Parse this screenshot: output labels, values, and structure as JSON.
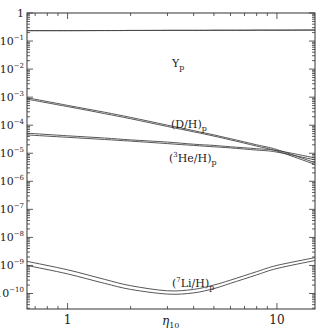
{
  "chart_data": {
    "type": "line",
    "title": "",
    "xlabel": "η10",
    "ylabel": "",
    "xscale": "log",
    "yscale": "log",
    "xlim": [
      0.64,
      15.2
    ],
    "ylim": [
      2.8e-11,
      1
    ],
    "x_tick_labels": [
      "1",
      "10"
    ],
    "y_tick_labels": [
      "1",
      "10^-1",
      "10^-2",
      "10^-3",
      "10^-4",
      "10^-5",
      "10^-6",
      "10^-7",
      "10^-8",
      "10^-9",
      "10^-10"
    ],
    "grid": false,
    "legend": "none (inline curve labels)",
    "x": [
      0.64,
      1,
      1.5,
      2,
      3,
      4,
      5,
      6,
      8,
      10,
      15.2
    ],
    "series": [
      {
        "name": "Yp upper",
        "label": "Yp",
        "values": [
          0.235,
          0.236,
          0.238,
          0.239,
          0.241,
          0.242,
          0.243,
          0.244,
          0.245,
          0.246,
          0.248
        ]
      },
      {
        "name": "Yp lower",
        "label": "",
        "values": [
          0.233,
          0.234,
          0.236,
          0.237,
          0.239,
          0.24,
          0.241,
          0.242,
          0.243,
          0.244,
          0.246
        ]
      },
      {
        "name": "(D/H)p upper",
        "label": "(D/H)p",
        "values": [
          0.00095,
          0.00051,
          0.00029,
          0.00019,
          0.0001,
          6.4e-05,
          4.5e-05,
          3.3e-05,
          2e-05,
          1.35e-05,
          4.6e-06
        ]
      },
      {
        "name": "(D/H)p lower",
        "label": "",
        "values": [
          0.00085,
          0.00046,
          0.00026,
          0.00017,
          9e-05,
          5.8e-05,
          4.1e-05,
          3e-05,
          1.8e-05,
          1.2e-05,
          4e-06
        ]
      },
      {
        "name": "(3He/H)p upper",
        "label": "(3He/H)p",
        "values": [
          5.2e-05,
          4.2e-05,
          3.5e-05,
          3e-05,
          2.5e-05,
          2.1e-05,
          1.9e-05,
          1.7e-05,
          1.45e-05,
          1.25e-05,
          6.8e-06
        ]
      },
      {
        "name": "(3He/H)p lower",
        "label": "",
        "values": [
          4.5e-05,
          3.7e-05,
          3.1e-05,
          2.7e-05,
          2.2e-05,
          1.9e-05,
          1.7e-05,
          1.55e-05,
          1.3e-05,
          1.1e-05,
          5.8e-06
        ]
      },
      {
        "name": "(7Li/H)p upper",
        "label": "(7Li/H)p",
        "values": [
          1.4e-09,
          7e-10,
          3.2e-10,
          1.9e-10,
          1.25e-10,
          1.4e-10,
          2e-10,
          3e-10,
          6e-10,
          1e-09,
          1.9e-09
        ]
      },
      {
        "name": "(7Li/H)p lower",
        "label": "",
        "values": [
          1e-09,
          5e-10,
          2.3e-10,
          1.4e-10,
          9.5e-11,
          1.05e-10,
          1.5e-10,
          2.3e-10,
          4.6e-10,
          7.8e-10,
          1.5e-09
        ]
      }
    ],
    "annotations": [
      {
        "text": "Yp",
        "x": 2.6,
        "y": 0.12
      },
      {
        "text": "(D/H)p",
        "x": 3.4,
        "y": 8e-05
      },
      {
        "text": "(3He/H)p",
        "x": 3.6,
        "y": 5.5e-06
      },
      {
        "text": "(7Li/H)p",
        "x": 3.1,
        "y": 1.7e-10
      }
    ]
  },
  "labels": {
    "x_axis": "η",
    "x_axis_sub": "10",
    "yp": "Y",
    "yp_sub": "p",
    "dh": "(D/H)",
    "dh_sub": "p",
    "he_pre": "(",
    "he_sup": "3",
    "he_post": "He/H)",
    "he_sub": "p",
    "li_pre": "(",
    "li_sup": "7",
    "li_post": "Li/H)",
    "li_sub": "p"
  }
}
